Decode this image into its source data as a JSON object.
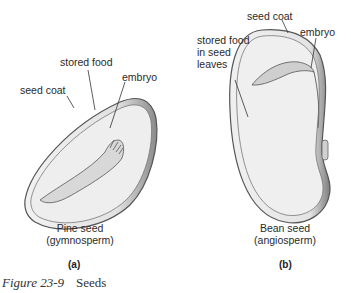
{
  "panels": [
    {
      "id": "a",
      "tag": "(a)",
      "name_line1": "Pine seed",
      "name_line2": "(gymnosperm)",
      "labels": {
        "stored_food": "stored food",
        "embryo": "embryo",
        "seed_coat": "seed coat"
      }
    },
    {
      "id": "b",
      "tag": "(b)",
      "name_line1": "Bean seed",
      "name_line2": "(angiosperm)",
      "labels": {
        "seed_coat": "seed coat",
        "embryo": "embryo",
        "stored_food_line1": "stored food",
        "stored_food_line2": "in seed",
        "stored_food_line3": "leaves"
      }
    }
  ],
  "caption": {
    "figure": "Figure 23-9",
    "title": "Seeds"
  }
}
